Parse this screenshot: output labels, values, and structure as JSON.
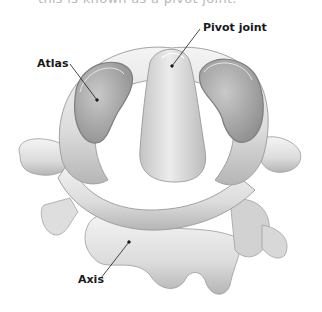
{
  "caption": {
    "text": "this is known as a pivot joint."
  },
  "figure": {
    "labels": [
      {
        "id": "atlas",
        "text": "Atlas"
      },
      {
        "id": "pivot",
        "text": "Pivot joint"
      },
      {
        "id": "axis",
        "text": "Axis"
      }
    ],
    "colors": {
      "bone_light": "#efefef",
      "bone_mid": "#c8c8c8",
      "bone_shadow": "#8f8f8f",
      "facet": "#a9a9a9",
      "leader_line": "#1a1a1a"
    }
  }
}
